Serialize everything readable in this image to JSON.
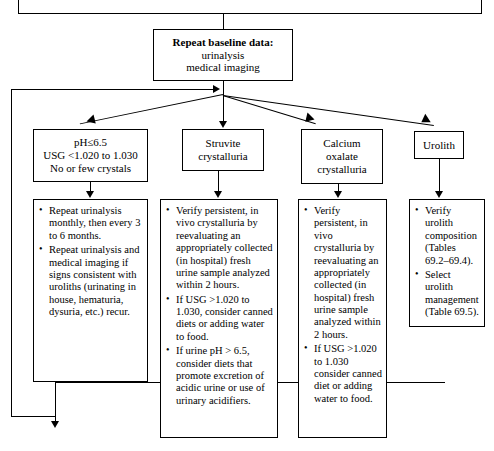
{
  "diagram": {
    "top_partial_box": {
      "label": ""
    },
    "repeat_baseline": {
      "heading": "Repeat baseline data:",
      "line2": "urinalysis",
      "line3": "medical imaging"
    },
    "branches": [
      {
        "id": "ph-usg",
        "header_lines": [
          "pH≤6.5",
          "USG <1.020 to 1.030",
          "No or few crystals"
        ],
        "bullets": [
          "Repeat urinalysis monthly, then every 3 to 6 months.",
          "Repeat urinalysis and medical imaging if signs consistent with uroliths (urinating in house, hematuria, dysuria, etc.) recur."
        ]
      },
      {
        "id": "struvite",
        "header_lines": [
          "Struvite",
          "crystalluria"
        ],
        "bullets": [
          "Verify persistent, in vivo crystalluria by reevaluating an appropriately collected (in hospital) fresh urine sample analyzed within 2 hours.",
          "If USG >1.020 to 1.030, consider canned diets or adding water to food.",
          "If urine pH > 6.5, consider diets that promote excretion of acidic urine or use of urinary acidifiers."
        ]
      },
      {
        "id": "calcium-oxalate",
        "header_lines": [
          "Calcium",
          "oxalate",
          "crystalluria"
        ],
        "bullets": [
          "Verify persistent, in vivo crystalluria by reevaluating an appropriately collected (in hospital) fresh urine sample analyzed within 2 hours.",
          "If USG >1.020 to 1.030 consider canned diet or adding water to food."
        ]
      },
      {
        "id": "urolith",
        "header_lines": [
          "Urolith"
        ],
        "bullets": [
          "Verify urolith composition (Tables 69.2–69.4).",
          "Select urolith management (Table 69.5)."
        ]
      }
    ],
    "colors": {
      "stroke": "#000000",
      "background": "#ffffff",
      "text": "#000000"
    }
  }
}
